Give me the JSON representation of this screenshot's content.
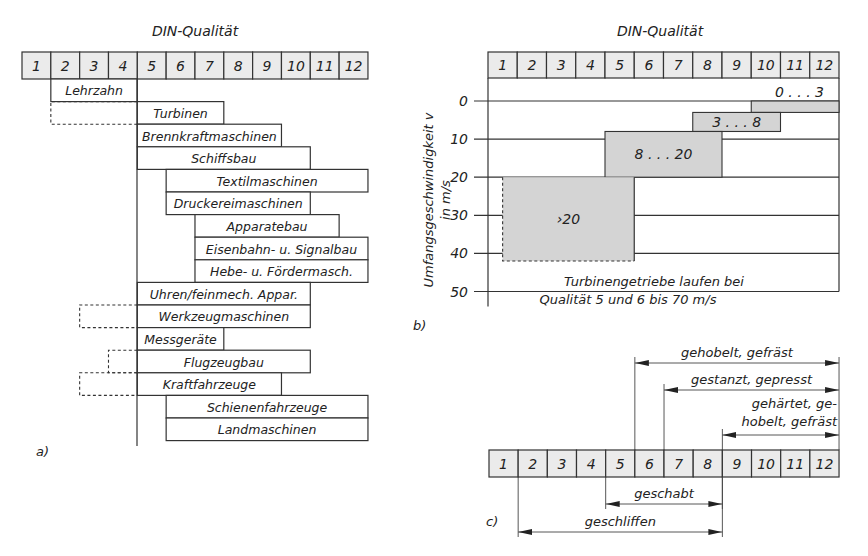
{
  "panel_a": {
    "title": "DIN-Qualität",
    "label": "a)",
    "qualities": [
      "1",
      "2",
      "3",
      "4",
      "5",
      "6",
      "7",
      "8",
      "9",
      "10",
      "11",
      "12"
    ],
    "bars": [
      {
        "label": "Lehrzahn",
        "from": 2,
        "to": 4
      },
      {
        "label": "Turbinen",
        "from": 5,
        "to": 7,
        "dashed_from": 2
      },
      {
        "label": "Brennkraftmaschinen",
        "from": 5,
        "to": 9
      },
      {
        "label": "Schiffsbau",
        "from": 5,
        "to": 10
      },
      {
        "label": "Textilmaschinen",
        "from": 6,
        "to": 12
      },
      {
        "label": "Druckereimaschinen",
        "from": 6,
        "to": 10
      },
      {
        "label": "Apparatebau",
        "from": 7,
        "to": 11
      },
      {
        "label": "Eisenbahn- u. Signalbau",
        "from": 7,
        "to": 12
      },
      {
        "label": "Hebe- u. Fördermasch.",
        "from": 7,
        "to": 12
      },
      {
        "label": "Uhren/feinmech. Appar.",
        "from": 5,
        "to": 10
      },
      {
        "label": "Werkzeugmaschinen",
        "from": 5,
        "to": 10,
        "dashed_from": 3
      },
      {
        "label": "Messgeräte",
        "from": 5,
        "to": 7
      },
      {
        "label": "Flugzeugbau",
        "from": 5,
        "to": 10,
        "dashed_from": 4
      },
      {
        "label": "Kraftfahrzeuge",
        "from": 5,
        "to": 9,
        "dashed_from": 3
      },
      {
        "label": "Schienenfahrzeuge",
        "from": 6,
        "to": 12
      },
      {
        "label": "Landmaschinen",
        "from": 6,
        "to": 12
      }
    ]
  },
  "panel_b": {
    "title": "DIN-Qualität",
    "label": "b)",
    "ylabel_line1": "Umfangsgeschwindigkeit  v",
    "ylabel_line2": "in  m/s",
    "qualities": [
      "1",
      "2",
      "3",
      "4",
      "5",
      "6",
      "7",
      "8",
      "9",
      "10",
      "11",
      "12"
    ],
    "yticks": [
      "0",
      "10",
      "20",
      "30",
      "40",
      "50"
    ],
    "ranges": [
      {
        "label": "0 . . . 3",
        "from_q": 10,
        "to_q": 12,
        "v_min": 0,
        "v_max": 3
      },
      {
        "label": "3 . . . 8",
        "from_q": 8,
        "to_q": 10,
        "v_min": 3,
        "v_max": 8
      },
      {
        "label": "8 . . . 20",
        "from_q": 5,
        "to_q": 8,
        "v_min": 8,
        "v_max": 20
      },
      {
        "label": "›20",
        "from_q": 1.5,
        "to_q": 5,
        "v_min": 20,
        "v_max": 42,
        "dashed": true
      }
    ],
    "note_line1": "Turbinengetriebe laufen bei",
    "note_line2": "Qualität 5 und 6 bis 70 m/s"
  },
  "panel_c": {
    "label": "c)",
    "qualities": [
      "1",
      "2",
      "3",
      "4",
      "5",
      "6",
      "7",
      "8",
      "9",
      "10",
      "11",
      "12"
    ],
    "above": [
      {
        "label": "gehobelt, gefräst",
        "from": 6,
        "to": 12
      },
      {
        "label": "gestanzt, gepresst",
        "from": 7,
        "to": 12
      },
      {
        "label_line1": "gehärtet, ge-",
        "label_line2": "hobelt, gefräst",
        "from": 9,
        "to": 12
      }
    ],
    "below": [
      {
        "label": "geschabt",
        "from": 5,
        "to": 8
      },
      {
        "label": "geschliffen",
        "from": 2,
        "to": 8
      }
    ]
  },
  "colors": {
    "stroke": "#333333",
    "header_fill": "#ebebeb",
    "range_fill": "#d4d4d4",
    "background": "#ffffff"
  }
}
